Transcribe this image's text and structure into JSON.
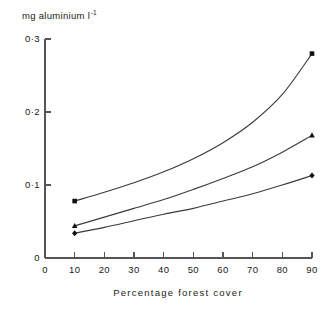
{
  "chart_data": {
    "type": "line",
    "title": "",
    "subtitle": "",
    "xlabel": "Percentage forest cover",
    "ylabel": "mg aluminium l-1",
    "ylabel_display": "mg aluminium l",
    "ylabel_superscript": "-1",
    "x": [
      10,
      20,
      30,
      40,
      50,
      60,
      70,
      80,
      90
    ],
    "xlim": [
      0,
      90
    ],
    "ylim": [
      0,
      0.31
    ],
    "xticks": [
      0,
      10,
      20,
      30,
      40,
      50,
      60,
      70,
      80,
      90
    ],
    "xtick_labels": [
      "0",
      "10",
      "20",
      "30",
      "40",
      "50",
      "60",
      "70",
      "80",
      "90"
    ],
    "yticks": [
      0,
      0.1,
      0.2,
      0.3
    ],
    "ytick_labels": [
      "0",
      "0·1",
      "0·2",
      "0·3"
    ],
    "grid": false,
    "legend": "none",
    "series": [
      {
        "name": "series-upper",
        "marker": "square",
        "color": "#111111",
        "values": [
          0.078,
          0.09,
          0.103,
          0.118,
          0.136,
          0.158,
          0.186,
          0.224,
          0.28
        ]
      },
      {
        "name": "series-middle",
        "marker": "triangle",
        "color": "#111111",
        "values": [
          0.044,
          0.056,
          0.068,
          0.08,
          0.094,
          0.109,
          0.125,
          0.145,
          0.168
        ]
      },
      {
        "name": "series-lower",
        "marker": "diamond",
        "color": "#111111",
        "values": [
          0.034,
          0.042,
          0.051,
          0.06,
          0.068,
          0.078,
          0.088,
          0.1,
          0.113
        ]
      }
    ]
  },
  "axes": {
    "y_title_text": "mg aluminium l",
    "y_title_sup": "-1",
    "x_title_text": "Percentage forest cover"
  }
}
